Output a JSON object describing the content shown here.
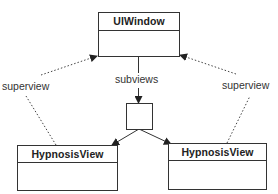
{
  "diagram": {
    "nodes": [
      {
        "id": "uiwindow",
        "title": "UIWindow"
      },
      {
        "id": "array",
        "title": ""
      },
      {
        "id": "hypnosis_left",
        "title": "HypnosisView"
      },
      {
        "id": "hypnosis_right",
        "title": "HypnosisView"
      }
    ],
    "edges": [
      {
        "from": "uiwindow",
        "to": "array",
        "label": "subviews",
        "style": "solid"
      },
      {
        "from": "array",
        "to": "hypnosis_left",
        "label": "",
        "style": "solid"
      },
      {
        "from": "array",
        "to": "hypnosis_right",
        "label": "",
        "style": "solid"
      },
      {
        "from": "hypnosis_left",
        "to": "uiwindow",
        "label": "superview",
        "style": "dotted"
      },
      {
        "from": "hypnosis_right",
        "to": "uiwindow",
        "label": "superview",
        "style": "dotted"
      }
    ]
  },
  "labels": {
    "subviews": "subviews",
    "superview_left": "superview",
    "superview_right": "superview"
  },
  "colors": {
    "line": "#333333",
    "background": "#ffffff"
  }
}
